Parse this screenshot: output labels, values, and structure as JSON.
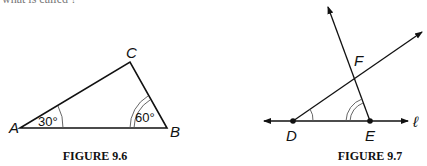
{
  "top_fragment": "what is called ?",
  "figures": [
    {
      "caption": "FIGURE 9.6",
      "vertices": {
        "A": "A",
        "B": "B",
        "C": "C"
      },
      "angles": {
        "A": "30°",
        "B": "60°"
      }
    },
    {
      "caption": "FIGURE 9.7",
      "points": {
        "D": "D",
        "E": "E",
        "F": "F"
      },
      "line_label": "ℓ"
    }
  ]
}
